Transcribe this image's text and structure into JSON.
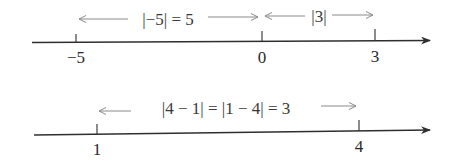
{
  "diagrams": [
    {
      "name": "number-line-1",
      "ticks": [
        {
          "value": "−5",
          "x": 76
        },
        {
          "value": "0",
          "x": 262
        },
        {
          "value": "3",
          "x": 375
        }
      ],
      "annotations": [
        {
          "text": "|−5| = 5",
          "from_x": 76,
          "to_x": 262
        },
        {
          "text": "|3|",
          "from_x": 262,
          "to_x": 375
        }
      ]
    },
    {
      "name": "number-line-2",
      "ticks": [
        {
          "value": "1",
          "x": 97
        },
        {
          "value": "4",
          "x": 359
        }
      ],
      "annotations": [
        {
          "text": "|4 − 1| = |1 − 4| = 3",
          "from_x": 97,
          "to_x": 359
        }
      ]
    }
  ],
  "colors": {
    "axis": "#2f2f2f",
    "arrow": "#8a8a8a",
    "text": "#2a2a2a"
  }
}
